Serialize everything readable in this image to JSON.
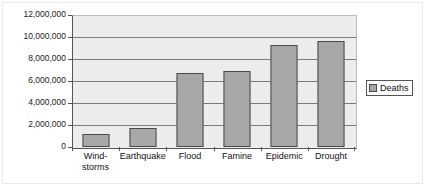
{
  "chart_data": {
    "type": "bar",
    "title": "",
    "subtitle": "",
    "xlabel": "",
    "ylabel": "",
    "categories": [
      "Wind-\nstorms",
      "Earthquake",
      "Flood",
      "Famine",
      "Epidemic",
      "Drought"
    ],
    "series": [
      {
        "name": "Deaths",
        "values": [
          1180000,
          1730000,
          6730000,
          6900000,
          9270000,
          9640000
        ]
      }
    ],
    "ylim": [
      0,
      12000000
    ],
    "ytick_values": [
      0,
      2000000,
      4000000,
      6000000,
      8000000,
      10000000,
      12000000
    ],
    "ytick_labels": [
      "0",
      "2,000,000",
      "4,000,000",
      "6,000,000",
      "8,000,000",
      "10,000,000",
      "12,000,000"
    ],
    "grid": true,
    "grid_axis": "y",
    "legend": {
      "position": "right",
      "entries": [
        "Deaths"
      ]
    },
    "colors": {
      "bar_fill": "#a8a8a8",
      "bar_border": "#4a4a4a",
      "plot_background": "#ececec",
      "gridline": "#7a7a7a",
      "axis": "#555555",
      "text": "#111111",
      "page_background": "#ffffff"
    }
  }
}
